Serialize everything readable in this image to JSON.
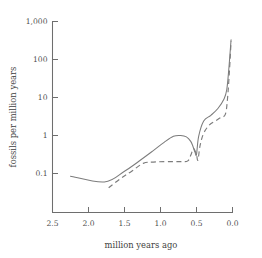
{
  "chart_data": {
    "type": "line",
    "title": "",
    "subtitle": "",
    "xlabel": "million years ago",
    "ylabel": "fossils per million years",
    "xlim": [
      2.5,
      0.0
    ],
    "ylim": [
      0.04,
      1000
    ],
    "x_axis_reversed": true,
    "y_scale": "log",
    "grid": false,
    "legend": "none",
    "xticks": [
      "2.5",
      "2.0",
      "1.5",
      "1.0",
      "0.5",
      "0.0"
    ],
    "xtick_values": [
      2.5,
      2.0,
      1.5,
      1.0,
      0.5,
      0.0
    ],
    "yticks": [
      "1,000",
      "100",
      "10",
      "1",
      "0.1"
    ],
    "ytick_values": [
      1000,
      100,
      10,
      1,
      0.1
    ],
    "series": [
      {
        "name": "solid-curve",
        "style": "solid",
        "color": "#7c7c7c",
        "x": [
          2.25,
          1.78,
          1.5,
          1.3,
          1.1,
          0.95,
          0.82,
          0.72,
          0.64,
          0.58,
          0.55,
          0.52,
          0.5,
          0.47,
          0.4,
          0.3,
          0.2,
          0.12,
          0.08,
          0.05,
          0.02
        ],
        "y": [
          0.085,
          0.06,
          0.115,
          0.21,
          0.4,
          0.66,
          0.95,
          1.0,
          0.92,
          0.7,
          0.52,
          0.36,
          0.32,
          0.95,
          2.4,
          3.4,
          5.2,
          9.0,
          16,
          60,
          330
        ]
      },
      {
        "name": "dashed-curve",
        "style": "dashed",
        "color": "#7c7c7c",
        "x": [
          1.72,
          1.55,
          1.4,
          1.24,
          1.1,
          0.9,
          0.7,
          0.62,
          0.58,
          0.54,
          0.5,
          0.48,
          0.45,
          0.4,
          0.32,
          0.24,
          0.16,
          0.1,
          0.07,
          0.04,
          0.02
        ],
        "y": [
          0.042,
          0.075,
          0.115,
          0.185,
          0.2,
          0.205,
          0.205,
          0.215,
          0.3,
          0.45,
          0.31,
          0.225,
          0.55,
          1.15,
          1.9,
          2.4,
          3.0,
          3.6,
          9.0,
          60,
          300
        ]
      }
    ],
    "annotations": []
  }
}
